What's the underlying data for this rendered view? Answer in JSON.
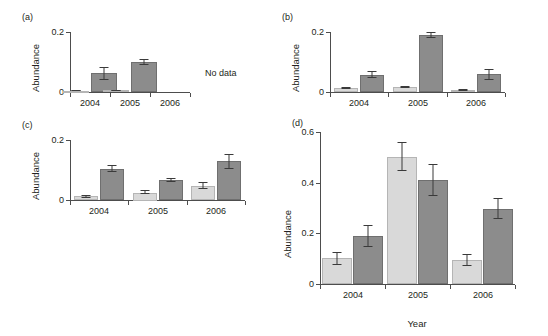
{
  "figure": {
    "background": "#ffffff",
    "series_colors": {
      "light": "#d9d9d9",
      "dark": "#8c8c8c"
    },
    "axis_color": "#4d4d4d"
  },
  "chart_data": [
    {
      "type": "bar",
      "panel": "(a)",
      "title": "",
      "xlabel": "",
      "ylabel": "Abundance",
      "categories": [
        "2004",
        "2005",
        "2006"
      ],
      "ylim": [
        0,
        0.2
      ],
      "yticks": [
        "0",
        "0.2"
      ],
      "ytick_values": [
        0,
        0.2
      ],
      "grid": false,
      "legend": "none",
      "annotation": "No data",
      "series": [
        {
          "name": "light",
          "values": [
            0.004,
            0.006,
            null
          ],
          "errors": [
            0.002,
            0.002,
            null
          ]
        },
        {
          "name": "dark",
          "values": [
            0.062,
            0.1,
            null
          ],
          "errors": [
            0.022,
            0.01,
            null
          ]
        }
      ]
    },
    {
      "type": "bar",
      "panel": "(b)",
      "title": "",
      "xlabel": "",
      "ylabel": "Abundance",
      "categories": [
        "2004",
        "2005",
        "2006"
      ],
      "ylim": [
        0,
        0.2
      ],
      "yticks": [
        "0",
        "0.2"
      ],
      "ytick_values": [
        0,
        0.2
      ],
      "grid": false,
      "legend": "none",
      "annotation": "",
      "series": [
        {
          "name": "light",
          "values": [
            0.013,
            0.016,
            0.007
          ],
          "errors": [
            0.003,
            0.003,
            0.004
          ]
        },
        {
          "name": "dark",
          "values": [
            0.058,
            0.19,
            0.059
          ],
          "errors": [
            0.012,
            0.01,
            0.018
          ]
        }
      ]
    },
    {
      "type": "bar",
      "panel": "(c)",
      "title": "",
      "xlabel": "",
      "ylabel": "Abundance",
      "categories": [
        "2004",
        "2005",
        "2006"
      ],
      "ylim": [
        0,
        0.2
      ],
      "yticks": [
        "0",
        "0.2"
      ],
      "ytick_values": [
        0,
        0.2
      ],
      "grid": false,
      "legend": "none",
      "annotation": "",
      "series": [
        {
          "name": "light",
          "values": [
            0.013,
            0.025,
            0.048
          ],
          "errors": [
            0.005,
            0.007,
            0.012
          ]
        },
        {
          "name": "dark",
          "values": [
            0.104,
            0.068,
            0.13
          ],
          "errors": [
            0.012,
            0.007,
            0.025
          ]
        }
      ]
    },
    {
      "type": "bar",
      "panel": "(d)",
      "title": "",
      "xlabel": "Year",
      "ylabel": "Abundance",
      "categories": [
        "2004",
        "2005",
        "2006"
      ],
      "ylim": [
        0,
        0.6
      ],
      "yticks": [
        "0",
        "0.2",
        "0.4",
        "0.6"
      ],
      "ytick_values": [
        0,
        0.2,
        0.4,
        0.6
      ],
      "grid": false,
      "legend": "none",
      "annotation": "",
      "series": [
        {
          "name": "light",
          "values": [
            0.103,
            0.503,
            0.094
          ],
          "errors": [
            0.025,
            0.058,
            0.023
          ]
        },
        {
          "name": "dark",
          "values": [
            0.191,
            0.411,
            0.297
          ],
          "errors": [
            0.043,
            0.064,
            0.041
          ]
        }
      ]
    }
  ]
}
